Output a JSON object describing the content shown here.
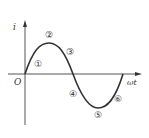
{
  "diagram": {
    "type": "sine-wave",
    "axes": {
      "y_label": "i",
      "x_label": "ωt",
      "origin_label": "O"
    },
    "points": [
      {
        "label": "①",
        "x": 38,
        "y": 64
      },
      {
        "label": "②",
        "x": 49,
        "y": 35
      },
      {
        "label": "③",
        "x": 70,
        "y": 52
      },
      {
        "label": "④",
        "x": 73,
        "y": 94
      },
      {
        "label": "⑤",
        "x": 98,
        "y": 115
      },
      {
        "label": "⑥",
        "x": 118,
        "y": 99
      }
    ],
    "colors": {
      "stroke": "#333333",
      "background": "#ffffff"
    }
  }
}
